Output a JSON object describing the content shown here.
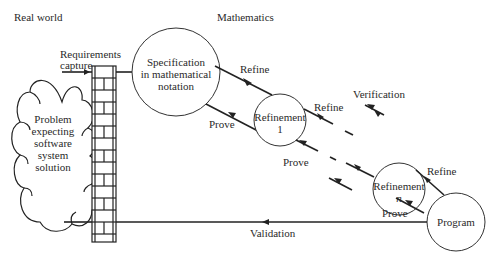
{
  "headers": {
    "left": "Real world",
    "right": "Mathematics"
  },
  "cloud": {
    "lines": [
      "Problem",
      "expecting",
      "software",
      "system",
      "solution"
    ]
  },
  "wall": {
    "label_lines": [
      "Requirements",
      "capture"
    ]
  },
  "nodes": {
    "specification": [
      "Specification",
      "in mathematical",
      "notation"
    ],
    "refinement1": [
      "Refinement",
      "1"
    ],
    "refinementn": [
      "Refinement",
      "n"
    ],
    "program": [
      "Program"
    ]
  },
  "edges": {
    "refine": "Refine",
    "prove": "Prove",
    "verification": "Verification",
    "validation": "Validation"
  },
  "colors": {
    "stroke": "#222222",
    "text": "#2a2a2a",
    "background": "#ffffff"
  }
}
